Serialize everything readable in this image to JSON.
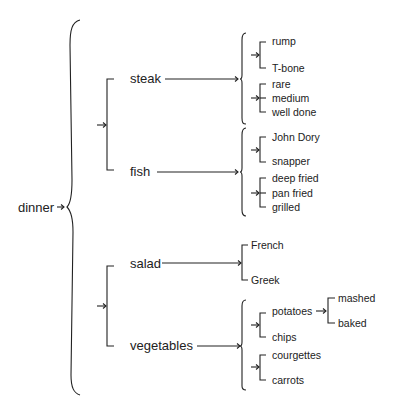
{
  "diagram": {
    "type": "bracket-tree",
    "root": {
      "label": "dinner",
      "children": [
        {
          "group": "meat-fish",
          "items": [
            {
              "label": "steak",
              "children": [
                {
                  "group": "cut",
                  "items": [
                    {
                      "label": "rump"
                    },
                    {
                      "label": "T-bone"
                    }
                  ]
                },
                {
                  "group": "doneness",
                  "items": [
                    {
                      "label": "rare"
                    },
                    {
                      "label": "medium"
                    },
                    {
                      "label": "well done"
                    }
                  ]
                }
              ]
            },
            {
              "label": "fish",
              "children": [
                {
                  "group": "type",
                  "items": [
                    {
                      "label": "John Dory"
                    },
                    {
                      "label": "snapper"
                    }
                  ]
                },
                {
                  "group": "cooking",
                  "items": [
                    {
                      "label": "deep fried"
                    },
                    {
                      "label": "pan fried"
                    },
                    {
                      "label": "grilled"
                    }
                  ]
                }
              ]
            }
          ]
        },
        {
          "group": "salad-veg",
          "items": [
            {
              "label": "salad",
              "children": [
                {
                  "group": "style",
                  "items": [
                    {
                      "label": "French"
                    },
                    {
                      "label": "Greek"
                    }
                  ]
                }
              ]
            },
            {
              "label": "vegetables",
              "children": [
                {
                  "group": "starch",
                  "items": [
                    {
                      "label": "potatoes",
                      "children": [
                        {
                          "label": "mashed"
                        },
                        {
                          "label": "baked"
                        }
                      ]
                    },
                    {
                      "label": "chips"
                    }
                  ]
                },
                {
                  "group": "greens",
                  "items": [
                    {
                      "label": "courgettes"
                    },
                    {
                      "label": "carrots"
                    }
                  ]
                }
              ]
            }
          ]
        }
      ]
    }
  },
  "labels": {
    "dinner": "dinner",
    "steak": "steak",
    "fish": "fish",
    "salad": "salad",
    "vegetables": "vegetables",
    "rump": "rump",
    "tbone": "T-bone",
    "rare": "rare",
    "medium": "medium",
    "well_done": "well done",
    "john_dory": "John Dory",
    "snapper": "snapper",
    "deep_fried": "deep fried",
    "pan_fried": "pan fried",
    "grilled": "grilled",
    "french": "French",
    "greek": "Greek",
    "potatoes": "potatoes",
    "mashed": "mashed",
    "baked": "baked",
    "chips": "chips",
    "courgettes": "courgettes",
    "carrots": "carrots"
  },
  "colors": {
    "line": "#222222",
    "text": "#222222",
    "background": "#ffffff"
  }
}
